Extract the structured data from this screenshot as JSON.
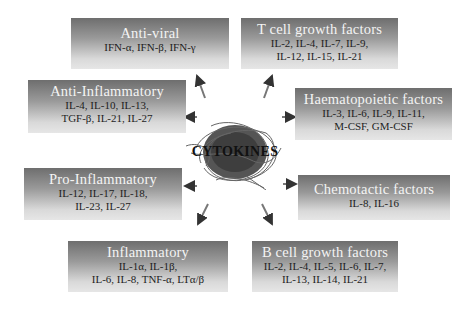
{
  "center": {
    "label": "CYTOKINES",
    "icon": "tangled-fiber-ball"
  },
  "categories": [
    {
      "id": "anti-viral",
      "title": "Anti-viral",
      "items": "IFN-α, IFN-β, IFN-γ"
    },
    {
      "id": "t-cell-growth",
      "title": "T cell growth factors",
      "items_line1": "IL-2, IL-4, IL-7, IL-9,",
      "items_line2": "IL-12, IL-15, IL-21"
    },
    {
      "id": "anti-inflammatory",
      "title": "Anti-Inflammatory",
      "items_line1": "IL-4, IL-10, IL-13,",
      "items_line2": "TGF-β,  IL-21, IL-27"
    },
    {
      "id": "haematopoietic",
      "title": "Haematopoietic factors",
      "items_line1": "IL-3, IL-6, IL-9, IL-11,",
      "items_line2": "M-CSF, GM-CSF"
    },
    {
      "id": "pro-inflammatory",
      "title": "Pro-Inflammatory",
      "items_line1": "IL-12, IL-17, IL-18,",
      "items_line2": "IL-23, IL-27"
    },
    {
      "id": "chemotactic",
      "title": "Chemotactic factors",
      "items": "IL-8, IL-16"
    },
    {
      "id": "inflammatory",
      "title": "Inflammatory",
      "items_line1": "IL-1α,  IL-1β,",
      "items_line2": "IL-6, IL-8, TNF-α,  LTα/β"
    },
    {
      "id": "b-cell-growth",
      "title": "B cell growth factors",
      "items_line1": "IL-2, IL-4, IL-5, IL-6, IL-7,",
      "items_line2": "IL-13, IL-14, IL-21"
    }
  ],
  "colors": {
    "box_gradient_top": "#6e6e6e",
    "box_gradient_bottom": "#e6e6e6",
    "title_text": "#f4f4f4",
    "item_text": "#1e1e1e",
    "arrow": "#555555"
  }
}
